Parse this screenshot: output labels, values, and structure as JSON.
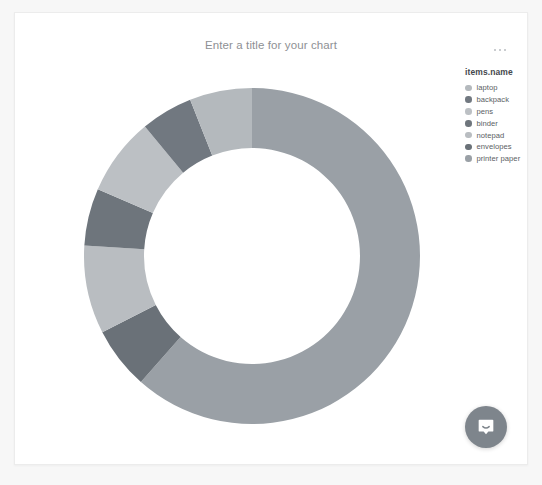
{
  "card": {
    "title_placeholder": "Enter a title for your chart",
    "menu_icon": "ellipsis-horizontal-icon",
    "menu_label": "…"
  },
  "legend": {
    "title": "items.name",
    "items": [
      {
        "label": "laptop",
        "color": "#b4b9bd"
      },
      {
        "label": "backpack",
        "color": "#717880"
      },
      {
        "label": "pens",
        "color": "#bcc0c4"
      },
      {
        "label": "binder",
        "color": "#6e757c"
      },
      {
        "label": "notepad",
        "color": "#b9bdc1"
      },
      {
        "label": "envelopes",
        "color": "#6a7178"
      },
      {
        "label": "printer paper",
        "color": "#9aa0a6"
      }
    ]
  },
  "chat": {
    "icon": "chat-bubble-icon",
    "button_color": "#7e858c"
  },
  "colors": {
    "page_background": "#f7f7f7",
    "card_background": "#ffffff",
    "card_border": "#ececec",
    "title_text": "#8e9094",
    "legend_title_text": "#44484d",
    "legend_label_text": "#5a5e63"
  },
  "chart_data": {
    "type": "pie",
    "variant": "donut",
    "title": "",
    "title_placeholder": "Enter a title for your chart",
    "legend_title": "items.name",
    "legend_position": "right",
    "grid": false,
    "center": {
      "x": 227,
      "y": 195
    },
    "outer_radius": 168,
    "inner_radius": 108,
    "start_angle_deg": 0,
    "direction": "clockwise",
    "categories": [
      "laptop",
      "backpack",
      "pens",
      "binder",
      "notepad",
      "envelopes",
      "printer paper"
    ],
    "values": [
      6.0,
      5.0,
      7.5,
      5.5,
      8.5,
      6.0,
      61.5
    ],
    "value_unit": "percent",
    "slices": [
      {
        "name": "printer paper",
        "percent": 61.5,
        "color": "#9aa0a6",
        "start_deg": 0.0,
        "end_deg": 221.4
      },
      {
        "name": "envelopes",
        "percent": 6.0,
        "color": "#6a7178",
        "start_deg": 221.4,
        "end_deg": 243.0
      },
      {
        "name": "notepad",
        "percent": 8.5,
        "color": "#b9bdc1",
        "start_deg": 243.0,
        "end_deg": 273.6
      },
      {
        "name": "binder",
        "percent": 5.5,
        "color": "#6e757c",
        "start_deg": 273.6,
        "end_deg": 293.4
      },
      {
        "name": "pens",
        "percent": 7.5,
        "color": "#bcc0c4",
        "start_deg": 293.4,
        "end_deg": 320.4
      },
      {
        "name": "backpack",
        "percent": 5.0,
        "color": "#717880",
        "start_deg": 320.4,
        "end_deg": 338.4
      },
      {
        "name": "laptop",
        "percent": 6.0,
        "color": "#b4b9bd",
        "start_deg": 338.4,
        "end_deg": 360.0
      }
    ]
  }
}
